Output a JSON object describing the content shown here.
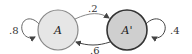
{
  "diagram": {
    "type": "markov-chain",
    "nodes": [
      {
        "id": "A",
        "label": "A",
        "fill": "#e6e6e6",
        "stroke": "#888888"
      },
      {
        "id": "A_prime",
        "label": "A'",
        "fill": "#cfcfcf",
        "stroke": "#333333"
      }
    ],
    "edges": [
      {
        "from": "A",
        "to": "A",
        "label": ".8"
      },
      {
        "from": "A",
        "to": "A_prime",
        "label": ".2"
      },
      {
        "from": "A_prime",
        "to": "A",
        "label": ".6"
      },
      {
        "from": "A_prime",
        "to": "A_prime",
        "label": ".4"
      }
    ]
  }
}
